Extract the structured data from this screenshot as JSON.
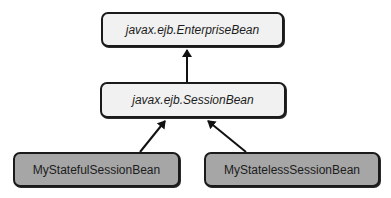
{
  "diagram": {
    "type": "uml-class-inheritance",
    "nodes": [
      {
        "id": "enterprise",
        "label": "javax.ejb.EnterpriseBean",
        "kind": "interface",
        "fill": "#f1f1f1"
      },
      {
        "id": "session",
        "label": "javax.ejb.SessionBean",
        "kind": "interface",
        "fill": "#f1f1f1"
      },
      {
        "id": "stateful",
        "label": "MyStatefulSessionBean",
        "kind": "class",
        "fill": "#a6a6a6"
      },
      {
        "id": "stateless",
        "label": "MyStatelessSessionBean",
        "kind": "class",
        "fill": "#a6a6a6"
      }
    ],
    "edges": [
      {
        "from": "session",
        "to": "enterprise",
        "type": "inheritance-arrow"
      },
      {
        "from": "stateful",
        "to": "session",
        "type": "inheritance-arrow"
      },
      {
        "from": "stateless",
        "to": "session",
        "type": "inheritance-arrow"
      }
    ],
    "colors": {
      "stroke": "#1a1a1a",
      "interface_fill": "#f1f1f1",
      "class_fill": "#a6a6a6",
      "background": "#ffffff"
    }
  }
}
